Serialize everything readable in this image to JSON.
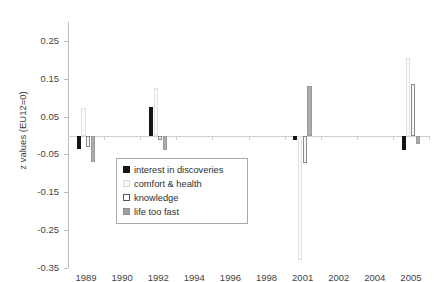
{
  "chart_data": {
    "type": "bar",
    "title": "",
    "xlabel": "",
    "ylabel": "z values (EU12=0)",
    "categories": [
      "1989",
      "1990",
      "1992",
      "1994",
      "1996",
      "1998",
      "2001",
      "2002",
      "2004",
      "2005"
    ],
    "yticks": [
      0.25,
      0.15,
      0.05,
      -0.05,
      -0.15,
      -0.25,
      -0.35
    ],
    "ytick_labels": [
      "0.25",
      "0.15",
      "0.05",
      "-0.05",
      "-0.15",
      "-0.25",
      "-0.35"
    ],
    "ylim": [
      -0.35,
      0.3
    ],
    "grid": false,
    "legend_position": "inside-lower-left",
    "series": [
      {
        "name": "interest in discoveries",
        "color": "#151515",
        "values": [
          -0.035,
          null,
          0.075,
          null,
          null,
          null,
          -0.012,
          null,
          null,
          -0.038
        ]
      },
      {
        "name": "comfort & health",
        "color": "#fbfbfb",
        "values": [
          0.072,
          null,
          0.125,
          null,
          null,
          null,
          -0.33,
          null,
          null,
          0.205
        ]
      },
      {
        "name": "knowledge",
        "color": "#f6f6f6",
        "values": [
          -0.03,
          null,
          -0.012,
          null,
          null,
          null,
          -0.072,
          null,
          null,
          0.135
        ]
      },
      {
        "name": "life too fast",
        "color": "#adadad",
        "values": [
          -0.07,
          null,
          -0.038,
          null,
          null,
          null,
          0.13,
          null,
          null,
          -0.022
        ]
      }
    ]
  },
  "legend": {
    "items": [
      {
        "label": "interest in discoveries"
      },
      {
        "label": "comfort & health"
      },
      {
        "label": "knowledge"
      },
      {
        "label": "life too fast"
      }
    ]
  }
}
